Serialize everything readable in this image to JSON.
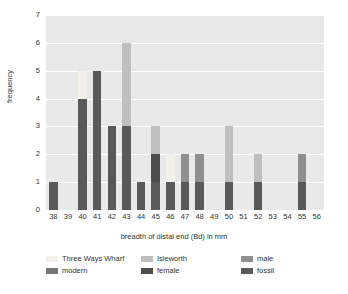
{
  "chart_data": {
    "type": "bar",
    "title": "",
    "xlabel": "breadth of distal end (Bd) in mm",
    "ylabel": "frequency",
    "xlim": [
      37.5,
      56.5
    ],
    "ylim": [
      0,
      7
    ],
    "ytick_labels": [
      "0",
      "1",
      "2",
      "3",
      "4",
      "5",
      "6",
      "7"
    ],
    "categories": [
      "38",
      "39",
      "40",
      "41",
      "42",
      "43",
      "44",
      "45",
      "46",
      "47",
      "48",
      "49",
      "50",
      "51",
      "52",
      "53",
      "54",
      "55",
      "56"
    ],
    "stacked": true,
    "grid": "horizontal-white",
    "legend_position": "below",
    "series": [
      {
        "name": "fossil",
        "color": "#595959",
        "values": [
          1,
          0,
          4,
          5,
          3,
          3,
          1,
          1,
          1,
          1,
          1,
          0,
          1,
          0,
          1,
          0,
          0,
          1,
          0
        ]
      },
      {
        "name": "female",
        "color": "#4d4d4d",
        "values": [
          0,
          0,
          0,
          0,
          0,
          0,
          0,
          1,
          0,
          0,
          0,
          0,
          0,
          0,
          0,
          0,
          0,
          0,
          0
        ]
      },
      {
        "name": "male",
        "color": "#8f8f8f",
        "values": [
          0,
          0,
          0,
          0,
          0,
          0,
          0,
          0,
          0,
          1,
          1,
          0,
          0,
          0,
          0,
          0,
          0,
          1,
          0
        ]
      },
      {
        "name": "modern",
        "color": "#777777",
        "values": [
          0,
          0,
          0,
          0,
          0,
          0,
          0,
          0,
          0,
          0,
          0,
          0,
          0,
          0,
          0,
          0,
          0,
          0,
          0
        ]
      },
      {
        "name": "Isleworth",
        "color": "#bfbfbf",
        "values": [
          0,
          0,
          0,
          0,
          0,
          3,
          0,
          1,
          0,
          0,
          0,
          0,
          2,
          0,
          1,
          0,
          0,
          0,
          0
        ]
      },
      {
        "name": "Three Ways Wharf",
        "color": "#f2f0ea",
        "values": [
          0,
          0,
          1,
          0,
          0,
          0,
          0,
          0,
          1,
          0,
          0,
          0,
          0,
          0,
          0,
          0,
          0,
          0,
          0
        ]
      }
    ]
  },
  "axes": {
    "ylabel": "frequency",
    "xlabel": "breadth of distal end (Bd) in mm"
  },
  "legend": {
    "entries": [
      {
        "label": "Three Ways Wharf",
        "color": "#f2f0ea"
      },
      {
        "label": "Isleworth",
        "color": "#bfbfbf"
      },
      {
        "label": "male",
        "color": "#8f8f8f"
      },
      {
        "label": "modern",
        "color": "#777777"
      },
      {
        "label": "female",
        "color": "#4d4d4d"
      },
      {
        "label": "fossil",
        "color": "#595959"
      }
    ]
  },
  "style": {
    "plot_background": "#e9e9e9",
    "gridline_color": "#ffffff",
    "page_background": "#ffffff",
    "text_color": "#333333"
  }
}
